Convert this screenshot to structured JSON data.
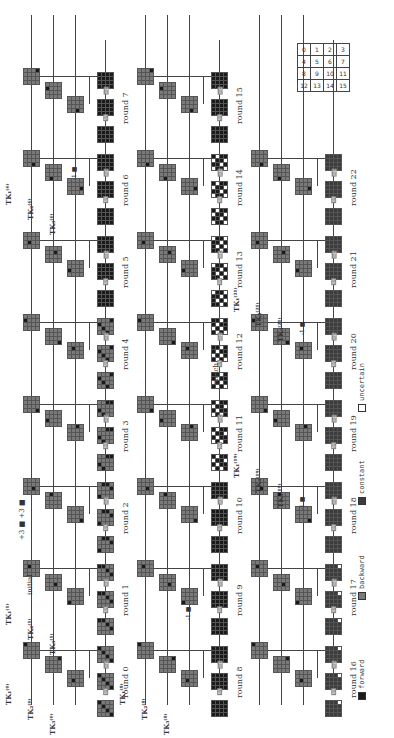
{
  "figure": {
    "orientation": "rotated-90-ccw",
    "colors": {
      "forward": "#1a1a1a",
      "backward": "#7a7a7a",
      "constant": "#3c3c3c",
      "uncertain": "#ffffff",
      "line": "#444444"
    },
    "legend": [
      {
        "key": "forward",
        "label": "forward",
        "color": "#1a1a1a"
      },
      {
        "key": "backward",
        "label": "backward",
        "color": "#7a7a7a"
      },
      {
        "key": "constant",
        "label": "constant",
        "color": "#3c3c3c"
      },
      {
        "key": "uncertain",
        "label": "uncertain",
        "color": "#ffffff"
      }
    ],
    "index_grid": [
      [
        "0",
        "1",
        "2",
        "3"
      ],
      [
        "4",
        "5",
        "6",
        "7"
      ],
      [
        "8",
        "9",
        "10",
        "11"
      ],
      [
        "12",
        "13",
        "14",
        "15"
      ]
    ],
    "annotations": {
      "initial": "initial",
      "plus3": "+3",
      "plus3b": "+3",
      "minus1": "-1",
      "match": "match"
    },
    "state_labels": [
      "X0",
      "Y0",
      "Z0",
      "X1",
      "Y1",
      "Z1",
      "X2",
      "Y2",
      "Z2",
      "X3",
      "Y3",
      "Z3",
      "X4",
      "Y4",
      "Z12",
      "X13"
    ],
    "op_labels": {
      "sr": "SR",
      "mc": "MC"
    },
    "tk_labels": [
      {
        "name": "TK1(0)",
        "text": "TK₁⁽⁰⁾"
      },
      {
        "name": "TK2(0)",
        "text": "TK₂⁽⁰⁾"
      },
      {
        "name": "TK3(0)",
        "text": "TK₃⁽⁰⁾"
      },
      {
        "name": "TK1(1)",
        "text": "TK₁⁽¹⁾"
      },
      {
        "name": "TK2(1)",
        "text": "TK₂⁽¹⁾"
      },
      {
        "name": "TK3(1)",
        "text": "TK₃⁽¹⁾"
      },
      {
        "name": "TK1(6)",
        "text": "TK₁⁽⁶⁾"
      },
      {
        "name": "TK2(6)",
        "text": "TK₂⁽⁶⁾"
      },
      {
        "name": "TK3(6)",
        "text": "TK₃⁽⁶⁾"
      },
      {
        "name": "TK1(8)",
        "text": "TK₁⁽⁸⁾"
      },
      {
        "name": "TK2(8)",
        "text": "TK₂⁽⁸⁾"
      },
      {
        "name": "TK3(8)",
        "text": "TK₃⁽⁸⁾"
      },
      {
        "name": "TK1(19)",
        "text": "TK₁⁽¹⁹⁾"
      },
      {
        "name": "TK2(19)",
        "text": "TK₂⁽¹⁹⁾"
      },
      {
        "name": "TK3(19)",
        "text": "TK₃⁽¹⁹⁾"
      },
      {
        "name": "TK1(21)",
        "text": "TK₁⁽²¹⁾"
      },
      {
        "name": "TK2(21)",
        "text": "TK₂⁽²¹⁾"
      },
      {
        "name": "TK3(21)",
        "text": "TK₃⁽²¹⁾"
      }
    ],
    "bands": [
      {
        "rounds": [
          "round 0",
          "round 1",
          "round 2",
          "round 3",
          "round 4",
          "round 5",
          "round 6",
          "round 7"
        ]
      },
      {
        "rounds": [
          "round 8",
          "round 9",
          "round 10",
          "round 11",
          "round 12",
          "round 13",
          "round 14",
          "round 15"
        ]
      },
      {
        "rounds": [
          "round 16",
          "round 17",
          "round 18",
          "round 19",
          "round 20",
          "round 21",
          "round 22"
        ]
      }
    ]
  }
}
